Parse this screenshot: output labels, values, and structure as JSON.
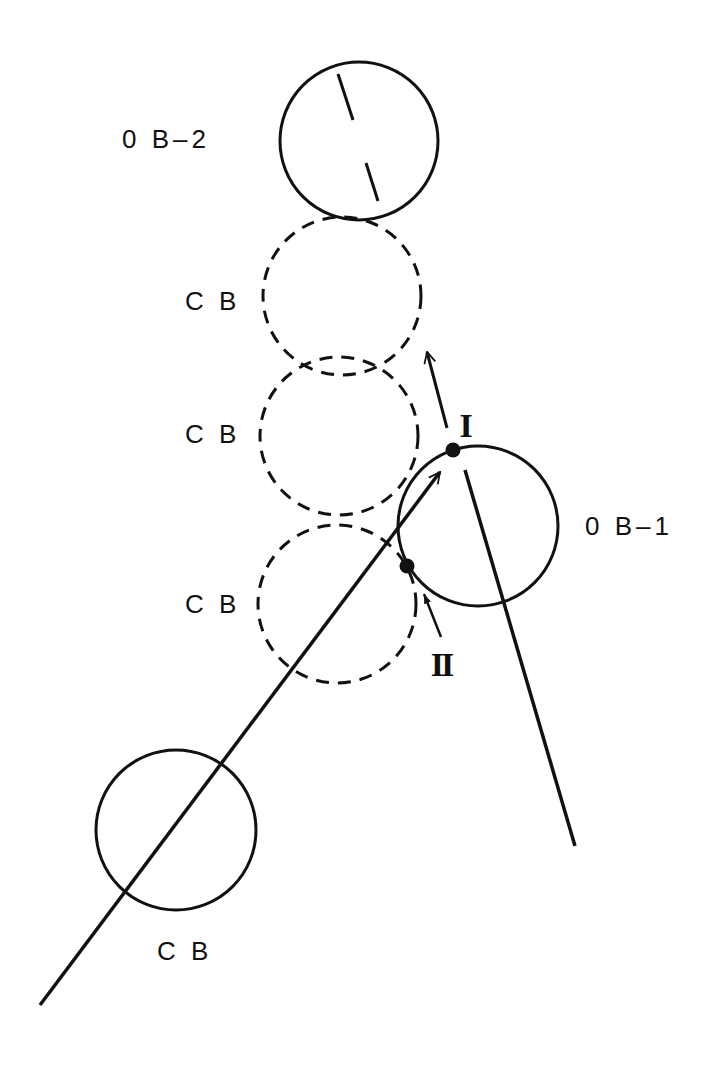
{
  "diagram": {
    "labels": {
      "ob2": "0 B–2",
      "ob1": "0 B–1",
      "cb1": "C B",
      "cb2": "C B",
      "cb3": "C B",
      "cb4": "C B",
      "point1": "I",
      "point2": "II"
    },
    "colors": {
      "stroke": "#111111",
      "background": "#ffffff"
    },
    "circles": [
      {
        "id": "OB-2",
        "style": "solid",
        "cx": 359,
        "cy": 141,
        "r": 79
      },
      {
        "id": "CB-dashed-1",
        "style": "dashed",
        "cx": 342,
        "cy": 296,
        "r": 79
      },
      {
        "id": "CB-dashed-2",
        "style": "dashed",
        "cx": 339,
        "cy": 436,
        "r": 79
      },
      {
        "id": "CB-dashed-3",
        "style": "dashed",
        "cx": 337,
        "cy": 604,
        "r": 79
      },
      {
        "id": "OB-1",
        "style": "solid",
        "cx": 478,
        "cy": 526,
        "r": 80
      },
      {
        "id": "CB-start",
        "style": "solid",
        "cx": 176,
        "cy": 830,
        "r": 80
      }
    ]
  }
}
